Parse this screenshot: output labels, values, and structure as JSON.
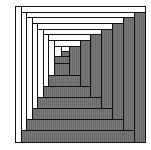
{
  "figure": {
    "colors": {
      "light": "#ffffff",
      "dark": "#707070",
      "line": "#111111"
    },
    "rings": {
      "left_x": [
        15,
        21,
        26,
        32,
        37,
        43,
        48,
        54
      ],
      "right_x": [
        145,
        134,
        123,
        112,
        101,
        90,
        80,
        69
      ],
      "top_y": [
        6,
        12,
        17,
        23,
        29,
        34,
        40,
        46
      ],
      "bottom_y": [
        142,
        130,
        119,
        108,
        97,
        86,
        75,
        63
      ]
    },
    "center": [
      {
        "x": 54,
        "y": 46,
        "w": 8,
        "h": 11,
        "tone": "w"
      },
      {
        "x": 61,
        "y": 46,
        "w": 8,
        "h": 6,
        "tone": "w"
      },
      {
        "x": 61,
        "y": 51,
        "w": 8,
        "h": 6,
        "tone": "g"
      },
      {
        "x": 54,
        "y": 56,
        "w": 15,
        "h": 7,
        "tone": "g"
      }
    ]
  }
}
